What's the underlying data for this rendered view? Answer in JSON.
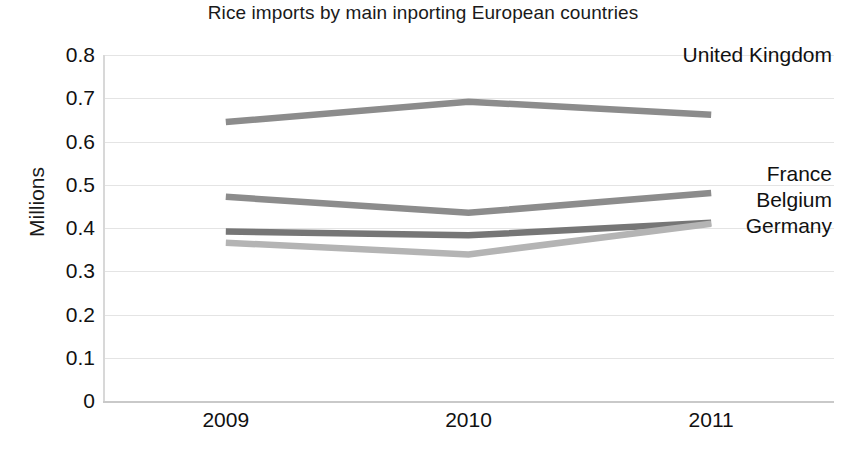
{
  "chart_data": {
    "type": "line",
    "title": "Rice imports by main inporting European countries",
    "xlabel": "",
    "ylabel": "Millions",
    "categories": [
      "2009",
      "2010",
      "2011"
    ],
    "x": [
      2009,
      2010,
      2011
    ],
    "ylim": [
      0,
      0.8
    ],
    "ytick_labels": [
      "0.8",
      "0.7",
      "0.6",
      "0.5",
      "0.4",
      "0.3",
      "0.2",
      "0.1",
      "0"
    ],
    "ytick_values": [
      0.8,
      0.7,
      0.6,
      0.5,
      0.4,
      0.3,
      0.2,
      0.1,
      0
    ],
    "grid": true,
    "legend_position": "right-inline-labels",
    "series": [
      {
        "name": "United Kingdom",
        "values": [
          0.645,
          0.692,
          0.662
        ],
        "color": "#8c8c8c"
      },
      {
        "name": "France",
        "values": [
          0.472,
          0.435,
          0.481
        ],
        "color": "#8c8c8c"
      },
      {
        "name": "Belgium",
        "values": [
          0.392,
          0.383,
          0.412
        ],
        "color": "#767676"
      },
      {
        "name": "Germany",
        "values": [
          0.366,
          0.339,
          0.41
        ],
        "color": "#b4b4b4"
      }
    ],
    "annotations": [
      {
        "text": "United Kingdom",
        "value": 0.8
      },
      {
        "text": "France",
        "value": 0.525
      },
      {
        "text": "Belgium",
        "value": 0.465
      },
      {
        "text": "Germany",
        "value": 0.405
      }
    ]
  },
  "colors": {
    "gridline": "#e4e4e4",
    "axis": "#c9c9c9",
    "text": "#111111",
    "background": "#ffffff"
  }
}
